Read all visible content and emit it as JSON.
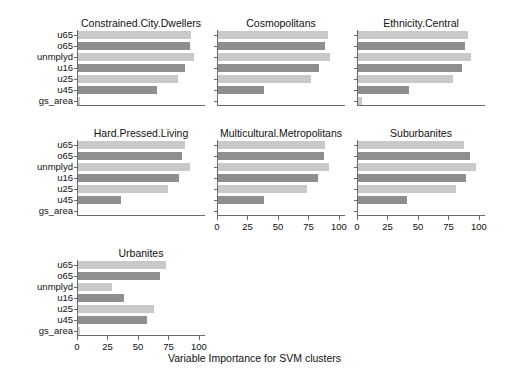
{
  "figure": {
    "xaxis_caption": "Variable Importance for SVM clusters",
    "x_ticks": [
      "0",
      "25",
      "50",
      "75",
      "100"
    ],
    "y_categories": [
      "u65",
      "o65",
      "unmplyd",
      "u16",
      "u25",
      "u45",
      "gs_area"
    ],
    "colors": {
      "bar_light": "#c9c9c9",
      "bar_dark": "#8f8f8f",
      "axis": "#6a6a6a",
      "text": "#111111",
      "background": "#ffffff"
    }
  },
  "chart_data": {
    "type": "bar",
    "title": "Variable Importance for SVM clusters",
    "xlabel": "Variable Importance for SVM clusters",
    "ylabel": "",
    "xlim": [
      0,
      105
    ],
    "x_ticks": [
      0,
      25,
      50,
      75,
      100
    ],
    "orientation": "horizontal",
    "grid": false,
    "legend": "none",
    "categories": [
      "u65",
      "o65",
      "unmplyd",
      "u16",
      "u25",
      "u45",
      "gs_area"
    ],
    "panel_layout": {
      "rows": 3,
      "cols": 3,
      "panels_used": 7
    },
    "panels": [
      {
        "title": "Constrained.City.Dwellers",
        "row": 0,
        "col": 0,
        "values": [
          93,
          92,
          95,
          88,
          82,
          65,
          2
        ]
      },
      {
        "title": "Cosmopolitans",
        "row": 0,
        "col": 1,
        "values": [
          90,
          88,
          92,
          83,
          76,
          38,
          0
        ]
      },
      {
        "title": "Ethnicity.Central",
        "row": 0,
        "col": 2,
        "values": [
          90,
          88,
          93,
          85,
          78,
          42,
          3
        ]
      },
      {
        "title": "Hard.Pressed.Living",
        "row": 1,
        "col": 0,
        "values": [
          88,
          85,
          92,
          83,
          74,
          35,
          0
        ]
      },
      {
        "title": "Multicultural.Metropolitans",
        "row": 1,
        "col": 1,
        "values": [
          88,
          87,
          91,
          82,
          73,
          38,
          0
        ]
      },
      {
        "title": "Suburbanites",
        "row": 1,
        "col": 2,
        "values": [
          87,
          92,
          97,
          89,
          80,
          40,
          0
        ]
      },
      {
        "title": "Urbanites",
        "row": 2,
        "col": 0,
        "values": [
          72,
          67,
          28,
          38,
          62,
          57,
          1
        ]
      }
    ]
  }
}
